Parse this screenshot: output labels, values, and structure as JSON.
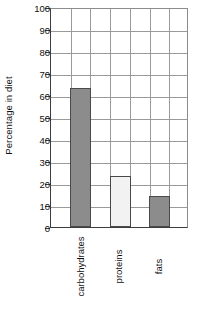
{
  "chart_data": {
    "type": "bar",
    "title": "",
    "subtitle": "",
    "xlabel": "",
    "ylabel": "Percentage in diet",
    "categories": [
      "carbohydrates",
      "proteins",
      "fats"
    ],
    "values": [
      63,
      23,
      14
    ],
    "series": [
      {
        "name": "Percentage in diet",
        "values": [
          63,
          23,
          14
        ]
      }
    ],
    "bar_colors": [
      "#8c8c8c",
      "#f2f2f2",
      "#8c8c8c"
    ],
    "bar_border_color": "#4a4a4a",
    "ylim": [
      0,
      100
    ],
    "ytick_labels": [
      "0",
      "10",
      "20",
      "30",
      "40",
      "50",
      "60",
      "70",
      "80",
      "90",
      "100"
    ],
    "ytick_values": [
      0,
      10,
      20,
      30,
      40,
      50,
      60,
      70,
      80,
      90,
      100
    ],
    "grid": "both",
    "grid_color": "#9a9a9a",
    "vertical_grid_count": 7,
    "legend": "none",
    "axis_color": "#3d3d3d",
    "background": "#ffffff",
    "text_color": "#111111"
  }
}
